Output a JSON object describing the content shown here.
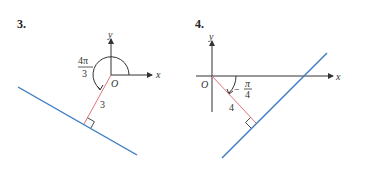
{
  "figures": [
    {
      "number": "3.",
      "axis_x_label": "x",
      "axis_y_label": "y",
      "origin_label": "O",
      "angle_label": {
        "numerator": "4π",
        "denominator": "3"
      },
      "distance_label": "3",
      "colors": {
        "line": "#3b7cc4",
        "perpendicular": "#e0747a",
        "axes": "#333333"
      }
    },
    {
      "number": "4.",
      "axis_x_label": "x",
      "axis_y_label": "y",
      "origin_label": "O",
      "angle_label": {
        "sign": "−",
        "numerator": "π",
        "denominator": "4"
      },
      "distance_label": "4",
      "colors": {
        "line": "#3b7cc4",
        "perpendicular": "#e0747a",
        "axes": "#333333"
      }
    }
  ]
}
